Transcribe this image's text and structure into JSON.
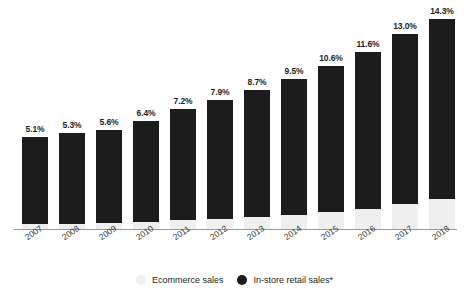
{
  "chart_data": {
    "type": "bar",
    "stacked": true,
    "stack_total_percent": 100,
    "title": "",
    "subtitle": "",
    "xlabel": "",
    "ylabel": "",
    "grid": false,
    "ylim": [
      0,
      100
    ],
    "legend_position": "bottom-center",
    "categories": [
      "2007",
      "2008",
      "2009",
      "2010",
      "2011",
      "2012",
      "2013",
      "2014",
      "2015",
      "2016",
      "2017",
      "2018"
    ],
    "series": [
      {
        "name": "Ecommerce sales",
        "color": "#efefef",
        "stack_position": "bottom",
        "labeled": true,
        "values": [
          5.1,
          5.3,
          5.6,
          6.4,
          7.2,
          7.9,
          8.7,
          9.5,
          10.6,
          11.6,
          13.0,
          14.3
        ],
        "value_labels": [
          "5.1%",
          "5.3%",
          "5.6%",
          "6.4%",
          "7.2%",
          "7.9%",
          "8.7%",
          "9.5%",
          "10.6%",
          "11.6%",
          "13.0%",
          "14.3%"
        ]
      },
      {
        "name": "In-store retail sales*",
        "color": "#1c1c1c",
        "stack_position": "top",
        "labeled": false,
        "values": [
          94.9,
          94.7,
          94.4,
          93.6,
          92.8,
          92.1,
          91.3,
          90.5,
          89.4,
          88.4,
          87.0,
          85.7
        ]
      }
    ],
    "bar_top_percent_of_plot": [
      40.5,
      42.0,
      43.5,
      47.5,
      52.5,
      56.5,
      61.0,
      66.0,
      71.5,
      77.5,
      85.5,
      92.0
    ]
  },
  "legend": {
    "items": [
      {
        "label": "Ecommerce sales",
        "marker": "light-dot"
      },
      {
        "label": "In-store retail sales*",
        "marker": "dark-dot"
      }
    ]
  },
  "colors": {
    "dark_series": "#1c1c1c",
    "light_series": "#efefef",
    "axis": "#9a9a9a",
    "label_text": "#231f20",
    "tick_text": "#3d3d3d",
    "background": "#ffffff"
  }
}
